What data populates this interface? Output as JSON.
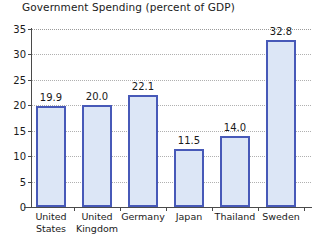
{
  "chart_data": {
    "type": "bar",
    "title": "Government Spending (percent of GDP)",
    "xlabel": "",
    "ylabel": "",
    "categories": [
      "United States",
      "United Kingdom",
      "Germany",
      "Japan",
      "Thailand",
      "Sweden"
    ],
    "category_lines": [
      [
        "United",
        "States"
      ],
      [
        "United",
        "Kingdom"
      ],
      [
        "Germany"
      ],
      [
        "Japan"
      ],
      [
        "Thailand"
      ],
      [
        "Sweden"
      ]
    ],
    "values": [
      19.9,
      20.0,
      22.1,
      11.5,
      14.0,
      32.8
    ],
    "value_labels": [
      "19.9",
      "20.0",
      "22.1",
      "11.5",
      "14.0",
      "32.8"
    ],
    "ylim": [
      0,
      35
    ],
    "yticks": [
      0,
      5,
      10,
      15,
      20,
      25,
      30,
      35
    ],
    "ytick_labels": [
      "0",
      "5",
      "10",
      "15",
      "20",
      "25",
      "30",
      "35"
    ],
    "grid": true,
    "grid_style": "dotted",
    "legend": false,
    "bar_fill_color": "#dce6f6",
    "bar_border_color": "#4759b8",
    "grid_color": "#b0b0b0",
    "axis_color": "#4a4a4a",
    "text_color": "#1a1a1a",
    "background_color": "#ffffff"
  }
}
